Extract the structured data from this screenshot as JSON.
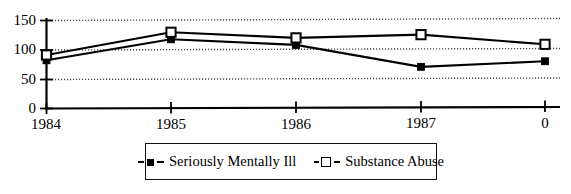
{
  "chart_data": {
    "type": "line",
    "title": "",
    "subtitle": "",
    "xlabel": "",
    "ylabel": "",
    "categories": [
      "1984",
      "1985",
      "1986",
      "1987",
      "0"
    ],
    "x_tick_labels": [
      "1984",
      "1985",
      "1986",
      "1987",
      "0"
    ],
    "y_tick_labels": [
      "0",
      "50",
      "100",
      "150"
    ],
    "y_ticks": [
      0,
      50,
      100,
      150
    ],
    "ylim": [
      0,
      150
    ],
    "grid": "horizontal-dotted",
    "legend_position": "below-center",
    "series": [
      {
        "name": "Seriously Mentally Ill",
        "marker": "filled-square",
        "values": [
          82,
          117,
          107,
          69,
          78
        ]
      },
      {
        "name": "Substance Abuse",
        "marker": "open-square",
        "values": [
          91,
          129,
          119,
          124,
          107
        ]
      }
    ],
    "colors": {
      "line": "#000000",
      "grid": "#555555",
      "axis": "#000000",
      "marker_fill_open": "#ffffff",
      "background": "#ffffff"
    }
  },
  "legend": {
    "items": [
      {
        "label": "Seriously Mentally Ill",
        "marker": "filled-square"
      },
      {
        "label": "Substance Abuse",
        "marker": "open-square"
      }
    ]
  }
}
